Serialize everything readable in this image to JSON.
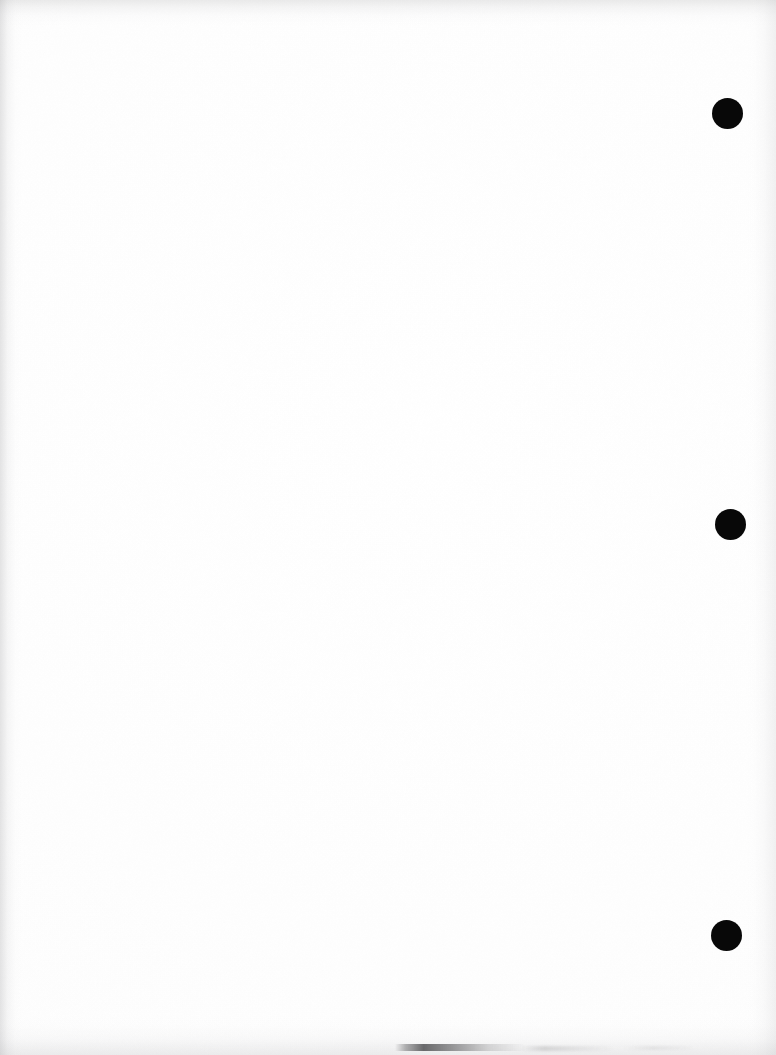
{
  "page": {
    "name": "scanned-blank-page",
    "width": 776,
    "height": 1055,
    "background_color": "#fefefe",
    "paper_color": "#ffffff",
    "content_text": ""
  },
  "marks": {
    "color": "#080808",
    "shape": "circle",
    "count": 3,
    "items": [
      {
        "id": "mark-top",
        "label": "",
        "cx": 727,
        "cy": 113,
        "diameter": 31
      },
      {
        "id": "mark-middle",
        "label": "",
        "cx": 730,
        "cy": 524,
        "diameter": 31
      },
      {
        "id": "mark-bottom",
        "label": "",
        "cx": 726,
        "cy": 935,
        "diameter": 31
      }
    ]
  },
  "artifacts": {
    "edge_shading_color": "#b4b4b7",
    "smudge_color": "#464648",
    "edges": [
      "top",
      "left",
      "right",
      "bottom"
    ]
  }
}
